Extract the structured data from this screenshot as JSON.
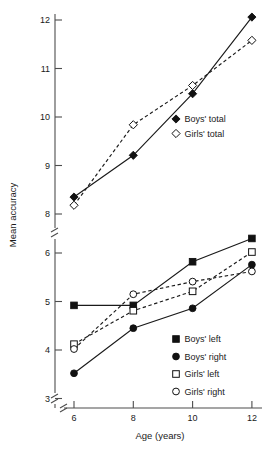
{
  "chart_data": {
    "type": "line",
    "title": "",
    "xlabel": "Age (years)",
    "ylabel": "Mean accuracy",
    "x": [
      6,
      8,
      10,
      12
    ],
    "xtick_labels": [
      "6",
      "8",
      "10",
      "12"
    ],
    "xlim": [
      5.3,
      12.6
    ],
    "grid": false,
    "axis_break": {
      "y_upper_panel": [
        7.85,
        12.3
      ],
      "y_lower_panel": [
        2.82,
        6.45
      ],
      "note": "y-axis has a break between 6 and 8, and another break below 3"
    },
    "ytick_labels_upper": [
      "12",
      "11",
      "10",
      "9",
      "8"
    ],
    "ytick_labels_lower": [
      "6",
      "5",
      "4",
      "3"
    ],
    "legend_position": "inside-right (two blocks)",
    "series": [
      {
        "name": "Boys' total",
        "marker": "filled-diamond",
        "line": "solid",
        "panel": "upper",
        "values": [
          8.35,
          9.21,
          10.48,
          12.06
        ]
      },
      {
        "name": "Girls' total",
        "marker": "open-diamond",
        "line": "dashed",
        "panel": "upper",
        "values": [
          8.18,
          9.84,
          10.65,
          11.58
        ]
      },
      {
        "name": "Boys' left",
        "marker": "filled-square",
        "line": "solid",
        "panel": "lower",
        "values": [
          4.92,
          4.92,
          5.82,
          6.3
        ]
      },
      {
        "name": "Boys' right",
        "marker": "filled-circle",
        "line": "solid",
        "panel": "lower",
        "values": [
          3.52,
          4.45,
          4.86,
          5.76
        ]
      },
      {
        "name": "Girls' left",
        "marker": "open-square",
        "line": "dashed",
        "panel": "lower",
        "values": [
          4.12,
          4.81,
          5.21,
          6.02
        ]
      },
      {
        "name": "Girls' right",
        "marker": "open-circle",
        "line": "dashed",
        "panel": "lower",
        "values": [
          4.02,
          5.15,
          5.41,
          5.62
        ]
      }
    ]
  },
  "axes": {
    "x_title": "Age (years)",
    "y_title": "Mean accuracy",
    "x_ticks": [
      "6",
      "8",
      "10",
      "12"
    ],
    "y_ticks_upper": [
      "12",
      "11",
      "10",
      "9",
      "8"
    ],
    "y_ticks_lower": [
      "6",
      "5",
      "4",
      "3"
    ]
  },
  "legend_top": {
    "items": [
      {
        "label": "Boys' total",
        "marker": "filled-diamond"
      },
      {
        "label": "Girls' total",
        "marker": "open-diamond"
      }
    ]
  },
  "legend_bottom": {
    "items": [
      {
        "label": "Boys' left",
        "marker": "filled-square"
      },
      {
        "label": "Boys' right",
        "marker": "filled-circle"
      },
      {
        "label": "Girls' left",
        "marker": "open-square"
      },
      {
        "label": "Girls' right",
        "marker": "open-circle"
      }
    ]
  },
  "colors": {
    "ink": "#111111",
    "axis": "#4d4d4d",
    "background": "#ffffff"
  }
}
